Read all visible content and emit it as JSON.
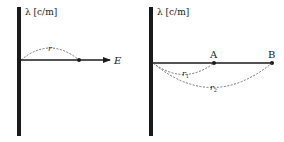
{
  "panels": [
    {
      "id": "left",
      "charge_label": "λ [c/m]",
      "distance_label": "r",
      "field_label": "E"
    },
    {
      "id": "right",
      "charge_label": "λ [c/m]",
      "point_a_label": "A",
      "point_b_label": "B",
      "r1_label": "r",
      "r1_sub": "1",
      "r2_label": "r",
      "r2_sub": "2"
    }
  ],
  "colors": {
    "line": "#1a1a1a",
    "dashed": "#555555",
    "background": "#ffffff"
  }
}
